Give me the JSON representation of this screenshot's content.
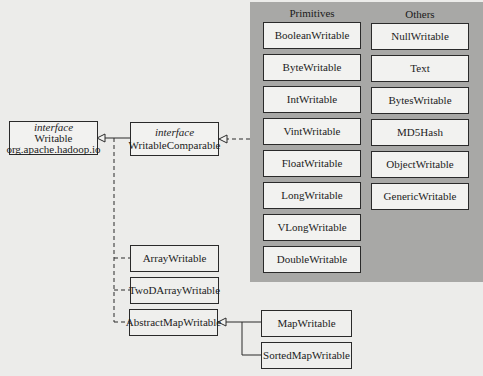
{
  "diagram": {
    "root": {
      "stereotype": "interface",
      "name": "Writable",
      "package": "org.apache.hadoop.io"
    },
    "comparable": {
      "stereotype": "interface",
      "name": "WritableComparable"
    },
    "groups": {
      "primitives": {
        "title": "Primitives",
        "items": [
          "BooleanWritable",
          "ByteWritable",
          "IntWritable",
          "VintWritable",
          "FloatWritable",
          "LongWritable",
          "VLongWritable",
          "DoubleWritable"
        ]
      },
      "others": {
        "title": "Others",
        "items": [
          "NullWritable",
          "Text",
          "BytesWritable",
          "MD5Hash",
          "ObjectWritable",
          "GenericWritable"
        ]
      }
    },
    "direct_writables": [
      "ArrayWritable",
      "TwoDArrayWritable",
      "AbstractMapWritable"
    ],
    "map_writables": [
      "MapWritable",
      "SortedMapWritable"
    ],
    "relations": [
      {
        "from": "WritableComparable",
        "to": "Writable",
        "type": "generalization"
      },
      {
        "from": "Primitives/Others group",
        "to": "WritableComparable",
        "type": "realization"
      },
      {
        "from": "ArrayWritable",
        "to": "Writable",
        "type": "realization"
      },
      {
        "from": "TwoDArrayWritable",
        "to": "Writable",
        "type": "realization"
      },
      {
        "from": "AbstractMapWritable",
        "to": "Writable",
        "type": "realization"
      },
      {
        "from": "MapWritable",
        "to": "AbstractMapWritable",
        "type": "generalization"
      },
      {
        "from": "SortedMapWritable",
        "to": "AbstractMapWritable",
        "type": "generalization"
      }
    ],
    "colors": {
      "background": "#ececea",
      "panel": "#a8a8a6",
      "box_fill": "#f2f2f0",
      "stroke": "#2a2a2a"
    }
  }
}
